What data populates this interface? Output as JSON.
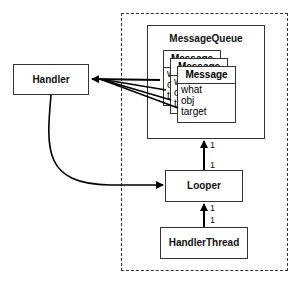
{
  "diagram": {
    "process_boundary": {
      "style": "dashed"
    },
    "handler": {
      "label": "Handler"
    },
    "message_queue": {
      "label": "MessageQueue"
    },
    "messages": [
      {
        "title": "Message",
        "fields": [
          "what",
          "obj",
          "target"
        ]
      },
      {
        "title": "Message",
        "fields": [
          "what",
          "obj",
          "target"
        ]
      },
      {
        "title": "Message",
        "fields": [
          "what",
          "obj",
          "target"
        ]
      }
    ],
    "looper": {
      "label": "Looper"
    },
    "handler_thread": {
      "label": "HandlerThread"
    },
    "multiplicities": {
      "queue_looper_top": "1",
      "queue_looper_bottom": "1",
      "looper_thread_top": "1",
      "looper_thread_bottom": "1"
    },
    "connections": [
      {
        "from": "Message.target",
        "to": "Handler",
        "type": "arrow"
      },
      {
        "from": "Handler",
        "to": "Looper",
        "type": "arrow"
      },
      {
        "from": "Looper",
        "to": "MessageQueue",
        "type": "arrow",
        "multiplicity": "1..1"
      },
      {
        "from": "HandlerThread",
        "to": "Looper",
        "type": "arrow",
        "multiplicity": "1..1"
      }
    ]
  }
}
